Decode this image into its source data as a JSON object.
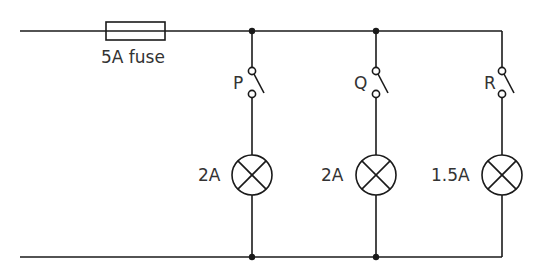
{
  "diagram": {
    "type": "parallel circuit",
    "fuse": {
      "label": "5A fuse"
    },
    "branches": [
      {
        "switch_label": "P",
        "lamp_label": "2A"
      },
      {
        "switch_label": "Q",
        "lamp_label": "2A"
      },
      {
        "switch_label": "R",
        "lamp_label": "1.5A"
      }
    ]
  },
  "colors": {
    "line": "#1a1a1a",
    "text": "#333333",
    "background": "#ffffff"
  }
}
